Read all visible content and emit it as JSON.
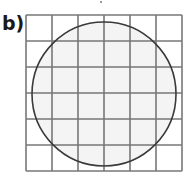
{
  "label": "b)",
  "figure": {
    "grid": {
      "rows": 6,
      "cols": 6,
      "x": 26,
      "y": 15,
      "cell": 26,
      "line_color": "#777777"
    },
    "circle": {
      "cx": 104,
      "cy": 94,
      "r": 72,
      "stroke": "#3a3a3a",
      "fill": "#f4f4f4"
    }
  }
}
